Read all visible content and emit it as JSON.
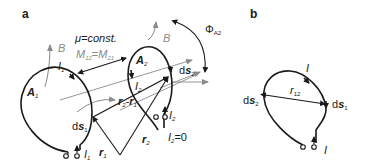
{
  "panels": {
    "a": {
      "label": "a",
      "mu_text": "μ=const.",
      "mutual": {
        "m12": "M",
        "m12_sub": "12",
        "eq": "=",
        "m21": "M",
        "m21_sub": "21"
      },
      "b_field_1": "B",
      "b_field_2": "B",
      "area_1": {
        "main": "A",
        "sub": "1"
      },
      "area_2": {
        "main": "A",
        "sub": "2"
      },
      "current_1_top": {
        "main": "I",
        "sub": "1"
      },
      "current_1_bottom": {
        "main": "I",
        "sub": "1"
      },
      "current_2_left": {
        "main": "I",
        "sub": "2"
      },
      "current_2_bottom": {
        "main": "I",
        "sub": "2"
      },
      "flux": {
        "main": "Φ",
        "sub": "A2"
      },
      "ds1": {
        "d": "d",
        "s": "s",
        "sub": "1"
      },
      "ds2": {
        "d": "d",
        "s": "s",
        "sub": "2"
      },
      "r2_minus_r1": {
        "r2": "r",
        "r2_sub": "2",
        "minus": "-",
        "r1": "r",
        "r1_sub": "1"
      },
      "r1": {
        "main": "r",
        "sub": "1"
      },
      "r2": {
        "main": "r",
        "sub": "2"
      },
      "i2_zero": {
        "main": "I",
        "sub": "2",
        "eq": "=0"
      }
    },
    "b": {
      "label": "b",
      "current_top": "I",
      "current_bottom": "I",
      "r12": {
        "main": "r",
        "sub": "12"
      },
      "ds1": {
        "d": "d",
        "s": "s",
        "sub": "1"
      },
      "ds2": {
        "d": "d",
        "s": "s",
        "sub": "2"
      }
    }
  },
  "colors": {
    "line": "#1a1a1a",
    "field": "#8a8a8a"
  }
}
